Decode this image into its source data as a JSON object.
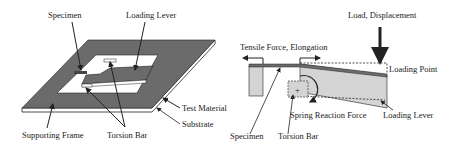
{
  "left_figure": {
    "labels": {
      "specimen": "Specimen",
      "loading_lever": "Loading Lever",
      "test_material": "Test Material",
      "substrate": "Substrate",
      "supporting_frame": "Supporting Frame",
      "torsion_bar": "Torsion Bar"
    }
  },
  "right_figure": {
    "labels": {
      "load_displacement": "Load, Displacement",
      "tensile_force": "Tensile Force, Elongation",
      "loading_point": "Loading Point",
      "spring_reaction": "Spring Reaction Force",
      "loading_lever": "Loading Lever",
      "specimen": "Specimen",
      "torsion_bar": "Torsion Bar",
      "plus_sign": "+"
    }
  },
  "colors": {
    "material": "#6b6b6b",
    "lever_fill": "#d4d4d4",
    "line": "#222222"
  }
}
